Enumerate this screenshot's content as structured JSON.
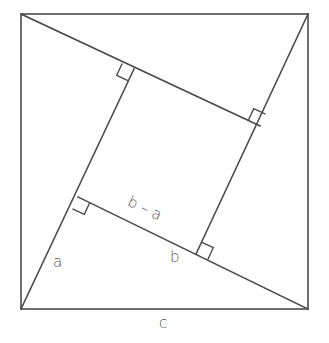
{
  "diagram": {
    "stroke_color": "#4a4a4a",
    "label_color": "#555555",
    "outer_square": {
      "x1": 21,
      "y1": 14,
      "x2": 308,
      "y2": 309
    },
    "inner_square": [
      [
        134,
        69
      ],
      [
        260,
        126
      ],
      [
        196,
        254
      ],
      [
        78,
        197
      ]
    ],
    "labels": {
      "b_minus_a": "b – a",
      "a": "a",
      "b": "b",
      "c": "c"
    },
    "right_angle_marker_size": 13
  }
}
